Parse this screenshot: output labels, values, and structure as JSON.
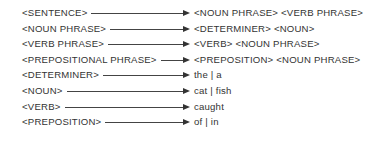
{
  "diagram": {
    "type": "grammar-production-rules",
    "rules": [
      {
        "lhs": "<SENTENCE>",
        "rhs": "<NOUN PHRASE>  <VERB PHRASE>"
      },
      {
        "lhs": "<NOUN PHRASE>",
        "rhs": "<DETERMINER>  <NOUN>"
      },
      {
        "lhs": "<VERB PHRASE>",
        "rhs": "<VERB>  <NOUN PHRASE>"
      },
      {
        "lhs": "<PREPOSITIONAL PHRASE>",
        "rhs": "<PREPOSITION>  <NOUN PHRASE>"
      },
      {
        "lhs": "<DETERMINER>",
        "rhs": "the | a"
      },
      {
        "lhs": "<NOUN>",
        "rhs": "cat | fish"
      },
      {
        "lhs": "<VERB>",
        "rhs": "caught"
      },
      {
        "lhs": "<PREPOSITION>",
        "rhs": "of | in"
      }
    ],
    "arrow_icon": "right-arrow-icon",
    "colors": {
      "text": "#333333",
      "arrow": "#333333",
      "background": "#ffffff"
    }
  }
}
